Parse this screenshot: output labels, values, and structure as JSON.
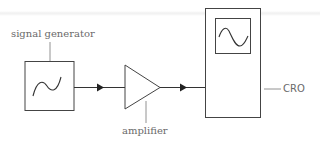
{
  "diagram": {
    "title": "",
    "colors": {
      "stroke": "#3a3a3a",
      "label": "#6a6a6a",
      "background": "#ffffff"
    },
    "nodes": [
      {
        "id": "signal_generator",
        "label": "signal generator",
        "shape": "box",
        "icon": "sine-wave-icon"
      },
      {
        "id": "amplifier",
        "label": "amplifier",
        "shape": "triangle"
      },
      {
        "id": "cro",
        "label": "CRO",
        "shape": "tall-box",
        "icon": "sine-wave-screen-icon"
      }
    ],
    "edges": [
      {
        "from": "signal_generator",
        "to": "amplifier",
        "arrow": "forward"
      },
      {
        "from": "amplifier",
        "to": "cro",
        "arrow": "forward"
      }
    ]
  }
}
